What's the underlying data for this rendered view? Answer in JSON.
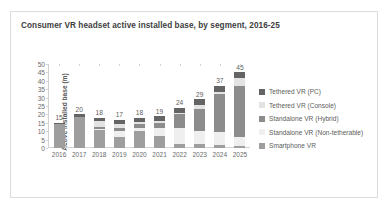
{
  "card": {
    "title": "Consumer VR headset active installed base, by segment, 2016-25",
    "border_color": "#dcdcdc",
    "background": "#ffffff"
  },
  "chart_data": {
    "type": "bar",
    "subtype": "stacked-column",
    "title": "Consumer VR headset active installed base, by segment, 2016-25",
    "xlabel": "",
    "ylabel": "Active installed base (m)",
    "ylim": [
      0,
      50
    ],
    "ytick_step": 5,
    "yticks": [
      "50",
      "45",
      "40",
      "35",
      "30",
      "25",
      "20",
      "15",
      "10",
      "5",
      "0"
    ],
    "grid": false,
    "legend_position": "right",
    "categories": [
      "2016",
      "2017",
      "2018",
      "2019",
      "2020",
      "2021",
      "2022",
      "2023",
      "2024",
      "2025"
    ],
    "totals": [
      15,
      20,
      18,
      17,
      18,
      19,
      24,
      29,
      37,
      45
    ],
    "series": [
      {
        "name": "Tethered VR (PC)",
        "color": "#646464",
        "values": [
          0.6,
          1.4,
          2.2,
          2.4,
          2.6,
          2.8,
          3.0,
          3.2,
          3.4,
          3.6
        ]
      },
      {
        "name": "Tethered VR (Console)",
        "color": "#e3e3e3",
        "values": [
          0.0,
          0.3,
          3.0,
          2.6,
          1.2,
          1.1,
          1.0,
          2.4,
          1.2,
          4.6
        ]
      },
      {
        "name": "Standalone VR (Hybrid)",
        "color": "#8c8c8c",
        "values": [
          0.0,
          0.0,
          1.2,
          1.6,
          2.2,
          3.2,
          8.0,
          13.0,
          23.0,
          30.0
        ]
      },
      {
        "name": "Standalone VR (Non-tetherable)",
        "color": "#efefef",
        "values": [
          0.0,
          0.0,
          0.6,
          3.6,
          1.8,
          5.0,
          9.6,
          8.2,
          7.4,
          5.6
        ]
      },
      {
        "name": "Smartphone VR",
        "color": "#9e9e9e",
        "values": [
          14.4,
          18.3,
          11.0,
          6.8,
          10.2,
          6.9,
          2.4,
          2.2,
          2.0,
          1.2
        ]
      }
    ]
  }
}
